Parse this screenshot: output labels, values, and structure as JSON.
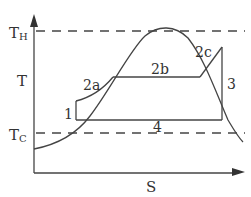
{
  "diagram": {
    "type": "T-S diagram",
    "axes": {
      "y_label": "T",
      "x_label": "S"
    },
    "reference_lines": {
      "hot": {
        "label_main": "T",
        "label_sub": "H"
      },
      "cold": {
        "label_main": "T",
        "label_sub": "C"
      }
    },
    "process_labels": {
      "p1": "1",
      "p2a": "2a",
      "p2b": "2b",
      "p2c": "2c",
      "p3": "3",
      "p4": "4"
    },
    "colors": {
      "line": "#444444",
      "text": "#333333",
      "background": "#ffffff"
    }
  }
}
